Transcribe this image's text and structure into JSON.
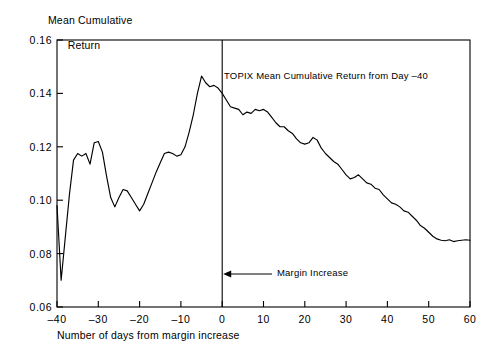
{
  "axes": {
    "y_axis_title_line1": "Mean Cumulative",
    "y_axis_title_line2": "Return",
    "x_axis_title": "Number of days from margin increase"
  },
  "annotations": {
    "series_label": "TOPIX Mean Cumulative Return from Day –40",
    "event_label": "Margin Increase"
  },
  "chart_data": {
    "type": "line",
    "title": "",
    "subtitle": "",
    "xlabel": "Number of days from margin increase",
    "ylabel": "Mean Cumulative Return",
    "xlim": [
      -40,
      60
    ],
    "ylim": [
      0.06,
      0.16
    ],
    "xticks": [
      -40,
      -30,
      -20,
      -10,
      0,
      10,
      20,
      30,
      40,
      50,
      60
    ],
    "xtick_labels": [
      "–40",
      "–30",
      "–20",
      "–10",
      "0",
      "10",
      "20",
      "30",
      "40",
      "50",
      "60"
    ],
    "yticks": [
      0.06,
      0.08,
      0.1,
      0.12,
      0.14,
      0.16
    ],
    "ytick_labels": [
      "0.06",
      "0.08",
      "0.10",
      "0.12",
      "0.14",
      "0.16"
    ],
    "grid": false,
    "legend": null,
    "event_line_x": 0,
    "series": [
      {
        "name": "TOPIX Mean Cumulative Return from Day –40",
        "color": "#000000",
        "x": [
          -40,
          -39,
          -38,
          -37,
          -36,
          -35,
          -34,
          -33,
          -32,
          -31,
          -30,
          -29,
          -28,
          -27,
          -26,
          -25,
          -24,
          -23,
          -22,
          -21,
          -20,
          -19,
          -18,
          -17,
          -16,
          -15,
          -14,
          -13,
          -12,
          -11,
          -10,
          -9,
          -8,
          -7,
          -6,
          -5,
          -4,
          -3,
          -2,
          -1,
          0,
          1,
          2,
          3,
          4,
          5,
          6,
          7,
          8,
          9,
          10,
          11,
          12,
          13,
          14,
          15,
          16,
          17,
          18,
          19,
          20,
          21,
          22,
          23,
          24,
          25,
          26,
          27,
          28,
          29,
          30,
          31,
          32,
          33,
          34,
          35,
          36,
          37,
          38,
          39,
          40,
          41,
          42,
          43,
          44,
          45,
          46,
          47,
          48,
          49,
          50,
          51,
          52,
          53,
          54,
          55,
          56,
          57,
          58,
          59,
          60
        ],
        "y": [
          0.098,
          0.07,
          0.086,
          0.102,
          0.115,
          0.1175,
          0.1165,
          0.1175,
          0.1135,
          0.1215,
          0.122,
          0.118,
          0.109,
          0.101,
          0.0975,
          0.101,
          0.104,
          0.1035,
          0.101,
          0.0985,
          0.096,
          0.0985,
          0.1025,
          0.1065,
          0.1105,
          0.114,
          0.1175,
          0.118,
          0.1175,
          0.1165,
          0.117,
          0.12,
          0.1255,
          0.132,
          0.14,
          0.1465,
          0.144,
          0.1425,
          0.143,
          0.142,
          0.14,
          0.1375,
          0.135,
          0.1345,
          0.134,
          0.132,
          0.133,
          0.1325,
          0.134,
          0.1335,
          0.134,
          0.133,
          0.131,
          0.129,
          0.1275,
          0.1275,
          0.126,
          0.125,
          0.123,
          0.1215,
          0.121,
          0.1215,
          0.1235,
          0.1225,
          0.1195,
          0.1175,
          0.116,
          0.1145,
          0.1135,
          0.1115,
          0.1095,
          0.108,
          0.1085,
          0.1095,
          0.108,
          0.1065,
          0.106,
          0.1045,
          0.104,
          0.102,
          0.1005,
          0.099,
          0.0985,
          0.0975,
          0.096,
          0.0955,
          0.094,
          0.0925,
          0.0905,
          0.0895,
          0.088,
          0.0865,
          0.0855,
          0.085,
          0.0848,
          0.0852,
          0.0845,
          0.0848,
          0.085,
          0.0852,
          0.085
        ]
      }
    ]
  },
  "colors": {
    "line": "#000000",
    "axis": "#000000",
    "background": "#ffffff"
  }
}
